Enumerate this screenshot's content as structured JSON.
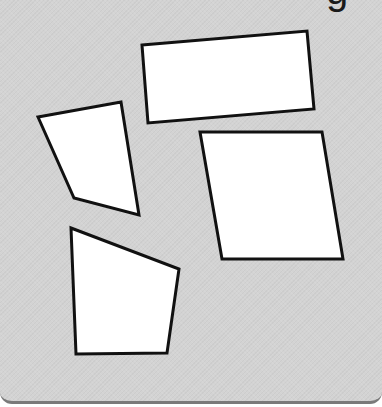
{
  "panel": {
    "background_color": "#d3d3d3",
    "bottom_border_color": "#7a7a7a"
  },
  "cropped_heading": {
    "visible_fragment": "g"
  },
  "shapes": [
    {
      "id": "shape-rectangle",
      "kind": "tilted rectangle",
      "points": "142,45 307,31 314,109 148,123",
      "fill": "#ffffff",
      "stroke": "#111111"
    },
    {
      "id": "shape-trapezoid-left",
      "kind": "irregular quadrilateral",
      "points": "38,117 121,102 139,215 74,198",
      "fill": "#ffffff",
      "stroke": "#111111"
    },
    {
      "id": "shape-parallelogram",
      "kind": "parallelogram",
      "points": "200,132 322,132 343,259 222,259",
      "fill": "#ffffff",
      "stroke": "#111111"
    },
    {
      "id": "shape-quadrilateral-bottom",
      "kind": "irregular quadrilateral",
      "points": "71,228 179,269 167,353 76,354",
      "fill": "#ffffff",
      "stroke": "#111111"
    }
  ]
}
